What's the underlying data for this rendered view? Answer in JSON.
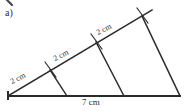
{
  "figure": {
    "part_label": "a)",
    "base_label": "7 cm",
    "segment_labels": [
      "2 cm",
      "2 cm",
      "2 cm"
    ],
    "stroke_color": "#2b2b2b",
    "background_color": "#ffffff",
    "shape": "triangle-with-parallel-transversals",
    "tick_count": 3
  }
}
